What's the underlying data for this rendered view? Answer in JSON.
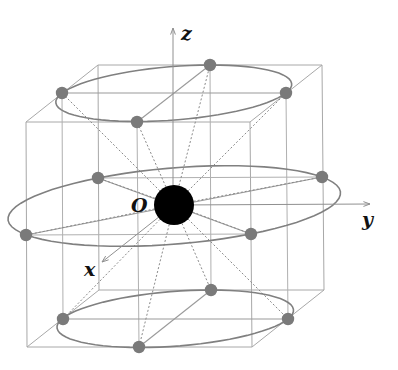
{
  "figure": {
    "type": "3D crystal/lattice coordination diagram",
    "labels": {
      "origin": "O",
      "x_axis": "x",
      "y_axis": "y",
      "z_axis": "z"
    },
    "colors": {
      "background": "#ffffff",
      "center_atom": "#000000",
      "surrounding_atoms": "#7a7a7a",
      "lines": "#a8a8a8",
      "rings": "#808080"
    },
    "center_atom": {
      "x": 174,
      "y": 205,
      "r": 20
    },
    "box": {
      "front_top_left": [
        26,
        122
      ],
      "front_top_right": [
        250,
        122
      ],
      "back_top_left": [
        98,
        65
      ],
      "back_top_right": [
        322,
        65
      ],
      "front_bottom_left": [
        27,
        347
      ],
      "front_bottom_right": [
        252,
        347
      ],
      "back_bottom_left": [
        99,
        290
      ],
      "back_bottom_right": [
        324,
        290
      ]
    },
    "rings": [
      {
        "name": "top",
        "atoms": [
          [
            210,
            65
          ],
          [
            286,
            93
          ],
          [
            137,
            122
          ],
          [
            62,
            93
          ]
        ]
      },
      {
        "name": "middle",
        "atoms": [
          [
            98,
            178
          ],
          [
            322,
            177
          ],
          [
            251,
            234
          ],
          [
            26,
            235
          ]
        ]
      },
      {
        "name": "bottom",
        "atoms": [
          [
            211,
            290
          ],
          [
            288,
            319
          ],
          [
            139,
            347
          ],
          [
            63,
            319
          ]
        ]
      }
    ],
    "axes": {
      "z": {
        "from": [
          173,
          205
        ],
        "to": [
          173,
          28
        ],
        "label_pos": [
          181,
          40
        ]
      },
      "y": {
        "from": [
          174,
          205
        ],
        "to": [
          370,
          204
        ],
        "label_pos": [
          362,
          226
        ]
      },
      "x": {
        "from": [
          174,
          205
        ],
        "to": [
          102,
          262
        ],
        "label_pos": [
          84,
          276
        ]
      }
    },
    "origin_label_pos": [
      131,
      212
    ]
  }
}
